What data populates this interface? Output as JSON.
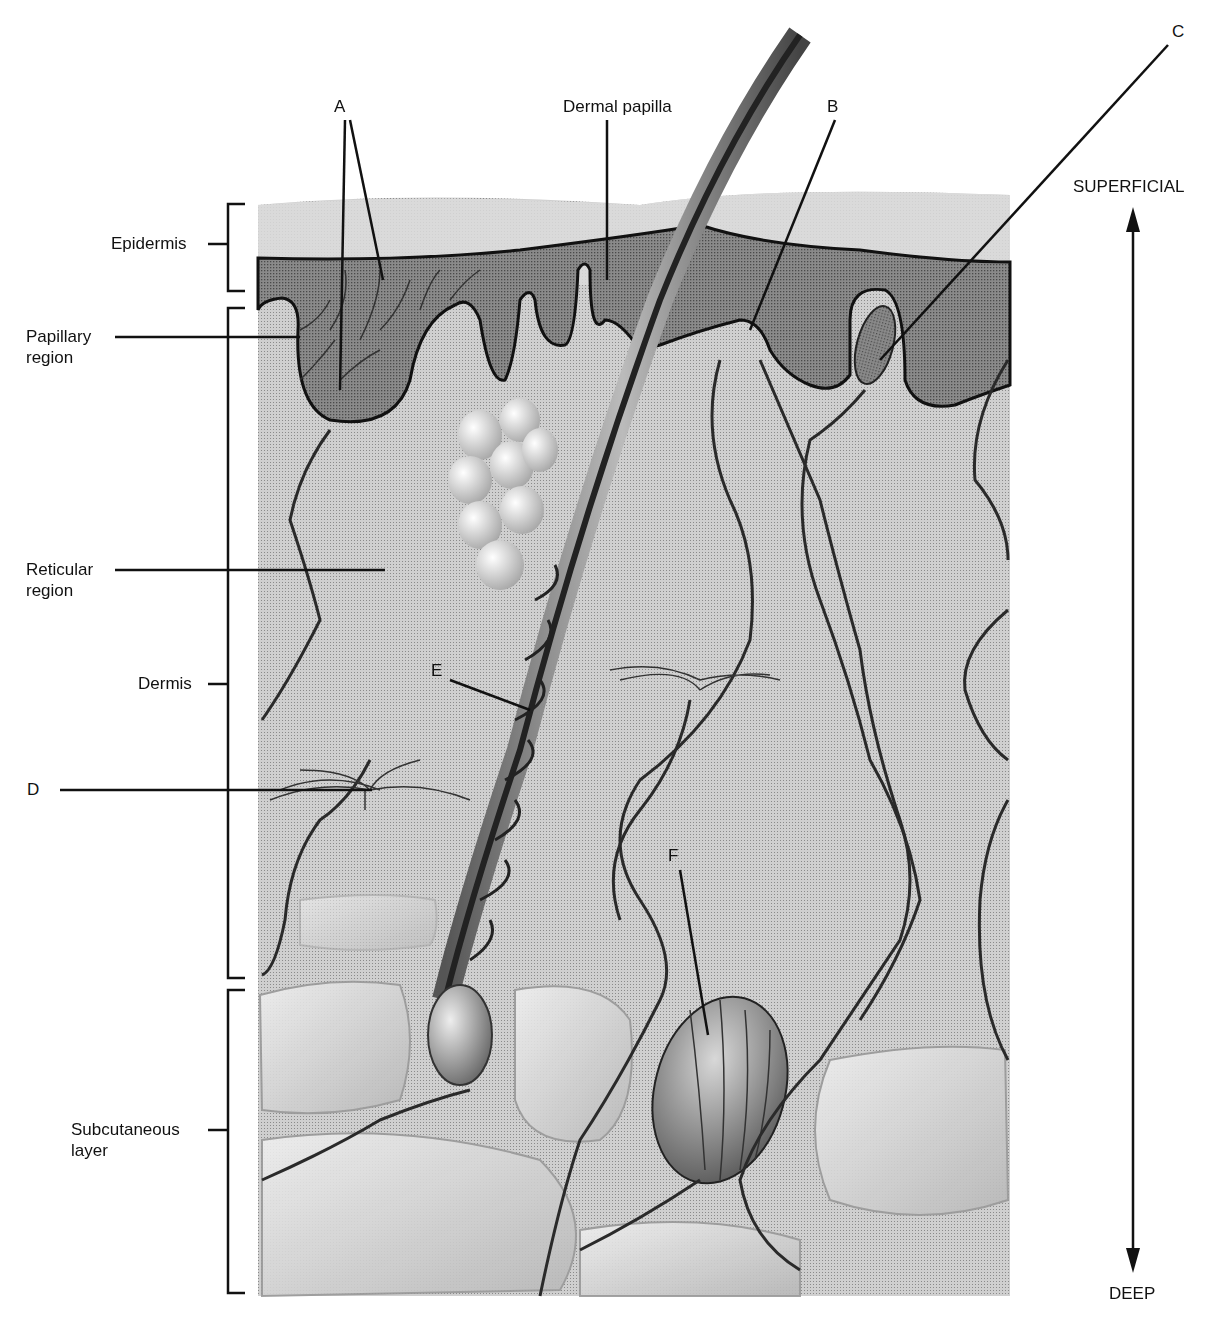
{
  "diagram": {
    "type": "anatomical cross-section of skin",
    "layer_labels": {
      "epidermis": "Epidermis",
      "papillary_region": [
        "Papillary",
        "region"
      ],
      "reticular_region": [
        "Reticular",
        "region"
      ],
      "dermis": "Dermis",
      "subcutaneous_layer": [
        "Subcutaneous",
        "layer"
      ]
    },
    "structure_labels": {
      "dermal_papilla": "Dermal papilla",
      "A": "A",
      "B": "B",
      "C": "C",
      "D": "D",
      "E": "E",
      "F": "F"
    },
    "orientation": {
      "top": "SUPERFICIAL",
      "bottom": "DEEP"
    },
    "colors": {
      "background": "#ffffff",
      "epidermis_fill": "#7d7d7d",
      "dermis_fill": "#c9c9c9",
      "subcutaneous_fill": "#bdbdbd",
      "surface_fill": "#d8d8d8",
      "line": "#111111"
    }
  }
}
